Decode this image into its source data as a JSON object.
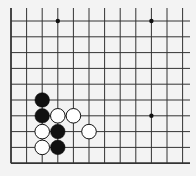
{
  "board": {
    "background": "#f3f3f3",
    "line_color": "#333333",
    "origin_x": 11,
    "origin_y": 21,
    "spacing_x": 15.6,
    "spacing_y": 15.8,
    "cols": 12,
    "rows": 10,
    "left_edge": true,
    "bottom_edge": true,
    "star_points": [
      [
        3,
        0
      ],
      [
        9,
        0
      ],
      [
        9,
        6
      ]
    ],
    "stones": [
      {
        "color": "black",
        "col": 2,
        "row": 5
      },
      {
        "color": "black",
        "col": 2,
        "row": 6
      },
      {
        "color": "white",
        "col": 3,
        "row": 6
      },
      {
        "color": "white",
        "col": 4,
        "row": 6
      },
      {
        "color": "white",
        "col": 2,
        "row": 7
      },
      {
        "color": "black",
        "col": 3,
        "row": 7
      },
      {
        "color": "white",
        "col": 5,
        "row": 7
      },
      {
        "color": "white",
        "col": 2,
        "row": 8
      },
      {
        "color": "black",
        "col": 3,
        "row": 8
      }
    ]
  }
}
